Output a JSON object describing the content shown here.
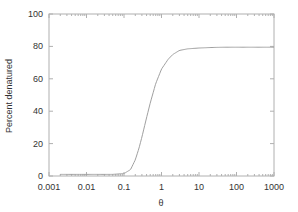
{
  "chart_data": {
    "type": "line",
    "title": "",
    "xlabel": "θ",
    "ylabel": "Percent denatured",
    "xscale": "log",
    "xlim": [
      0.001,
      1000
    ],
    "ylim": [
      0,
      100
    ],
    "grid": false,
    "legend": null,
    "x_ticks": [
      "0.001",
      "0.01",
      "0.1",
      "1",
      "10",
      "100",
      "1000"
    ],
    "y_ticks": [
      "0",
      "20",
      "40",
      "60",
      "80",
      "100"
    ],
    "series": [
      {
        "name": "denaturation",
        "color": "#a0a0a0",
        "x": [
          0.002,
          0.01,
          0.05,
          0.1,
          0.15,
          0.2,
          0.25,
          0.3,
          0.4,
          0.5,
          0.7,
          1,
          1.5,
          2,
          3,
          5,
          10,
          20,
          50,
          100,
          1000
        ],
        "y": [
          1,
          1,
          1,
          1.5,
          4,
          10,
          17,
          24,
          36,
          45,
          57,
          66,
          72,
          75,
          77.5,
          78.5,
          79,
          79.3,
          79.5,
          79.5,
          79.5
        ]
      }
    ]
  }
}
